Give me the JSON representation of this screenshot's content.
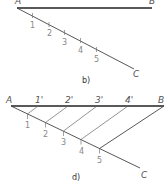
{
  "figure_b": {
    "caption": "b)",
    "points": {
      "A": "A",
      "B": "B",
      "C": "C"
    },
    "divisions": [
      "1",
      "2",
      "3",
      "4",
      "5"
    ]
  },
  "figure_d": {
    "caption": "d)",
    "points": {
      "A": "A",
      "B": "B",
      "C": "C"
    },
    "divisions": [
      "1",
      "2",
      "3",
      "4",
      "5"
    ],
    "projected": [
      "1'",
      "2'",
      "3'",
      "4'"
    ]
  },
  "colors": {
    "line_main": "#222222",
    "line_aux": "#555555",
    "label": "#555555"
  }
}
